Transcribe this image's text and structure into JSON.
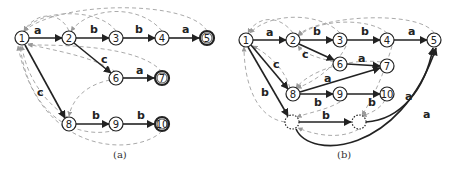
{
  "figure": {
    "panels": [
      {
        "caption": "(a)",
        "nodes": [
          {
            "id": "1",
            "label": "1",
            "x": 22,
            "y": 38,
            "accepting": false
          },
          {
            "id": "2",
            "label": "2",
            "x": 69,
            "y": 38,
            "accepting": false
          },
          {
            "id": "3",
            "label": "3",
            "x": 116,
            "y": 38,
            "accepting": false
          },
          {
            "id": "4",
            "label": "4",
            "x": 162,
            "y": 38,
            "accepting": false
          },
          {
            "id": "5",
            "label": "5",
            "x": 207,
            "y": 38,
            "accepting": true
          },
          {
            "id": "6",
            "label": "6",
            "x": 116,
            "y": 78,
            "accepting": false
          },
          {
            "id": "7",
            "label": "7",
            "x": 162,
            "y": 78,
            "accepting": true
          },
          {
            "id": "8",
            "label": "8",
            "x": 69,
            "y": 124,
            "accepting": false
          },
          {
            "id": "9",
            "label": "9",
            "x": 116,
            "y": 124,
            "accepting": false
          },
          {
            "id": "10",
            "label": "10",
            "x": 162,
            "y": 124,
            "accepting": true
          }
        ],
        "edges": [
          {
            "from": "1",
            "to": "2",
            "label": "a"
          },
          {
            "from": "2",
            "to": "3",
            "label": "b"
          },
          {
            "from": "3",
            "to": "4",
            "label": "b"
          },
          {
            "from": "4",
            "to": "5",
            "label": "a"
          },
          {
            "from": "2",
            "to": "6",
            "label": "c"
          },
          {
            "from": "6",
            "to": "7",
            "label": "a"
          },
          {
            "from": "1",
            "to": "8",
            "label": "c"
          },
          {
            "from": "8",
            "to": "9",
            "label": "b"
          },
          {
            "from": "9",
            "to": "10",
            "label": "b"
          }
        ]
      },
      {
        "caption": "(b)",
        "nodes": [
          {
            "id": "1",
            "label": "1",
            "x": 246,
            "y": 40
          },
          {
            "id": "2",
            "label": "2",
            "x": 293,
            "y": 40
          },
          {
            "id": "3",
            "label": "3",
            "x": 340,
            "y": 40
          },
          {
            "id": "4",
            "label": "4",
            "x": 387,
            "y": 40
          },
          {
            "id": "5",
            "label": "5",
            "x": 434,
            "y": 40
          },
          {
            "id": "6",
            "label": "6",
            "x": 340,
            "y": 64
          },
          {
            "id": "7",
            "label": "7",
            "x": 387,
            "y": 66
          },
          {
            "id": "8",
            "label": "8",
            "x": 293,
            "y": 94
          },
          {
            "id": "9",
            "label": "9",
            "x": 340,
            "y": 94
          },
          {
            "id": "10",
            "label": "10",
            "x": 387,
            "y": 94
          },
          {
            "id": "d1",
            "label": "",
            "x": 292,
            "y": 122,
            "dotted": true
          },
          {
            "id": "d2",
            "label": "",
            "x": 359,
            "y": 122,
            "dotted": true
          }
        ],
        "edges": [
          {
            "from": "1",
            "to": "2",
            "label": "a"
          },
          {
            "from": "2",
            "to": "3",
            "label": "b"
          },
          {
            "from": "3",
            "to": "4",
            "label": "b"
          },
          {
            "from": "4",
            "to": "5",
            "label": "a"
          },
          {
            "from": "2",
            "to": "6",
            "label": "c"
          },
          {
            "from": "6",
            "to": "7",
            "label": "a"
          },
          {
            "from": "1",
            "to": "8",
            "label": "c"
          },
          {
            "from": "8",
            "to": "7",
            "label": "a"
          },
          {
            "from": "8",
            "to": "9",
            "label": "b"
          },
          {
            "from": "9",
            "to": "10",
            "label": "b"
          },
          {
            "from": "1",
            "to": "d1",
            "label": "b"
          },
          {
            "from": "d1",
            "to": "d2",
            "label": "b"
          },
          {
            "from": "d2",
            "to": "5",
            "label": "a"
          },
          {
            "from": "d1",
            "to": "5",
            "label": "a"
          }
        ]
      }
    ]
  }
}
